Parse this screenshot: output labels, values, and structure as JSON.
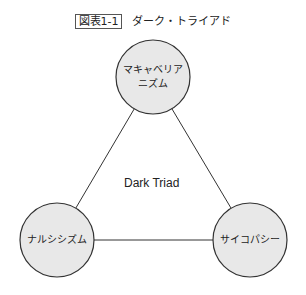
{
  "title": {
    "figure_label": "図表1-1",
    "caption": "ダーク・トライアド"
  },
  "diagram": {
    "center_label": "Dark Triad",
    "nodes": [
      {
        "line1": "マキャベリア",
        "line2": "ニズム"
      },
      {
        "line1": "ナルシシズム"
      },
      {
        "line1": "サイコパシー"
      }
    ],
    "colors": {
      "node_fill": "#e8e8e8",
      "stroke": "#333333"
    }
  }
}
